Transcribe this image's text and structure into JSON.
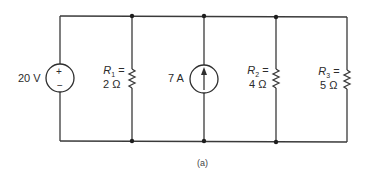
{
  "diagram": {
    "type": "electrical-circuit",
    "topology": "parallel",
    "caption": "(a)",
    "colors": {
      "wire": "#3a3a3a",
      "background": "#ffffff"
    },
    "components": [
      {
        "id": "V1",
        "kind": "voltage-source",
        "value_label": "20 V",
        "polarity_top": "+",
        "polarity_bottom": "−"
      },
      {
        "id": "R1",
        "kind": "resistor",
        "name": "R",
        "subscript": "1",
        "equals": "=",
        "value_label": "2 Ω"
      },
      {
        "id": "I1",
        "kind": "current-source",
        "value_label": "7 A",
        "direction": "up"
      },
      {
        "id": "R2",
        "kind": "resistor",
        "name": "R",
        "subscript": "2",
        "equals": "=",
        "value_label": "4 Ω"
      },
      {
        "id": "R3",
        "kind": "resistor",
        "name": "R",
        "subscript": "3",
        "equals": "=",
        "value_label": "5 Ω"
      }
    ]
  }
}
